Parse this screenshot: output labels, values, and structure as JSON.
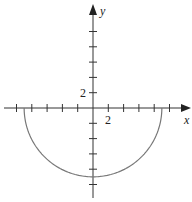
{
  "chart_data": {
    "type": "line",
    "title": "",
    "xlabel": "x",
    "ylabel": "y",
    "tick_step": 2,
    "tick_labels": {
      "x": "2",
      "y": "2"
    },
    "xlim": [
      -12,
      12.5
    ],
    "ylim": [
      -11.5,
      13.5
    ],
    "x_ticks": [
      -10,
      -8,
      -6,
      -4,
      -2,
      2,
      4,
      6,
      8,
      10
    ],
    "y_ticks": [
      -10,
      -8,
      -6,
      -4,
      -2,
      2,
      4,
      6,
      8,
      10
    ],
    "grid": false,
    "series": [
      {
        "name": "lower semicircle y = -sqrt(81 - x^2)",
        "x": [
          -9,
          -8,
          -6,
          -4,
          -2,
          0,
          2,
          4,
          6,
          8,
          9
        ],
        "y": [
          0,
          -4.12,
          -6.71,
          -8.06,
          -8.78,
          -9,
          -8.78,
          -8.06,
          -6.71,
          -4.12,
          0
        ]
      }
    ],
    "colors": {
      "axis": "#333333",
      "curve": "#777777"
    }
  },
  "labels": {
    "x_axis": "x",
    "y_axis": "y",
    "x_tick_2": "2",
    "y_tick_2": "2"
  }
}
